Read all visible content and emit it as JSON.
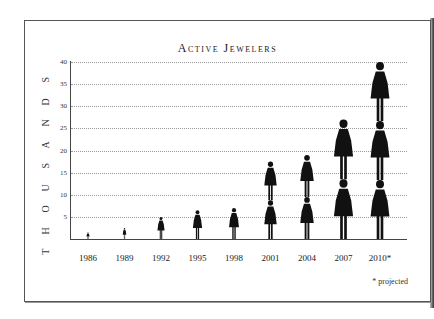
{
  "chart_data": {
    "type": "bar",
    "style": "pictograph",
    "title": "Active Jewelers",
    "xlabel": "",
    "ylabel": "THOUSANDS",
    "categories": [
      "1986",
      "1989",
      "1992",
      "1995",
      "1998",
      "2001",
      "2004",
      "2007",
      "2010*"
    ],
    "values": [
      1.5,
      2.5,
      5,
      6.5,
      7,
      17.5,
      19,
      27,
      40
    ],
    "ylim": [
      0,
      40
    ],
    "yticks": [
      "5",
      "10",
      "15",
      "20",
      "25",
      "30",
      "35",
      "40"
    ],
    "grid": true,
    "annotations": [
      "* projected"
    ],
    "legend": null
  },
  "title": "Active Jewelers",
  "ylabel_letters": [
    "S",
    "D",
    "N",
    "A",
    "S",
    "U",
    "O",
    "H",
    "T"
  ],
  "note": "* projected",
  "colors": {
    "figure": "#111111",
    "grid": "#9a9a9a",
    "axis": "#444444"
  }
}
